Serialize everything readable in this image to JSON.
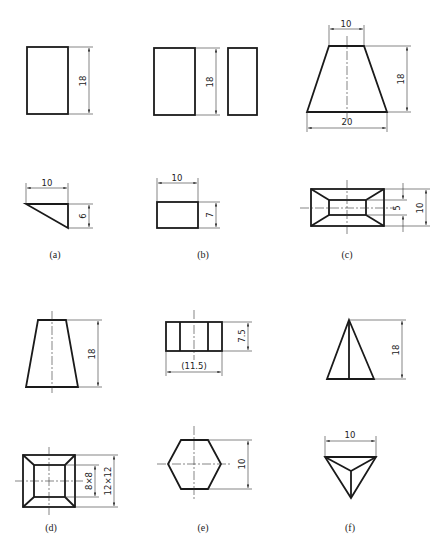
{
  "figure": {
    "panels": [
      {
        "id": "a",
        "caption": "(a)",
        "front_view": {
          "shape": "rectangle",
          "dims": {
            "height": "18"
          }
        },
        "top_view": {
          "shape": "right-triangle wedge",
          "dims": {
            "width": "10",
            "depth": "6"
          }
        }
      },
      {
        "id": "b",
        "caption": "(b)",
        "front_view": {
          "shape": "rectangle",
          "dims": {
            "height": "18"
          }
        },
        "side_view": {
          "shape": "narrow rectangle"
        },
        "top_view": {
          "shape": "rectangle",
          "dims": {
            "width": "10",
            "depth": "7"
          }
        }
      },
      {
        "id": "c",
        "caption": "(c)",
        "front_view": {
          "shape": "trapezoid",
          "dims": {
            "top": "10",
            "bottom": "20",
            "height": "18"
          }
        },
        "top_view": {
          "shape": "frustum rectangle",
          "dims": {
            "inner": "5",
            "outer": "10"
          }
        }
      },
      {
        "id": "d",
        "caption": "(d)",
        "front_view": {
          "shape": "trapezoid",
          "dims": {
            "height": "18"
          }
        },
        "top_view": {
          "shape": "square frustum",
          "dims": {
            "inner": "8×8",
            "outer": "12×12"
          }
        }
      },
      {
        "id": "e",
        "caption": "(e)",
        "front_view": {
          "shape": "hexagonal prism side",
          "dims": {
            "height": "7.5",
            "width": "(11.5)"
          }
        },
        "top_view": {
          "shape": "hexagon",
          "dims": {
            "across_flats": "10"
          }
        }
      },
      {
        "id": "f",
        "caption": "(f)",
        "front_view": {
          "shape": "triangle pyramid",
          "dims": {
            "height": "18"
          }
        },
        "top_view": {
          "shape": "triangle",
          "dims": {
            "width": "10"
          }
        }
      }
    ]
  },
  "labels": {
    "a_h18": "18",
    "a_w10": "10",
    "a_d6": "6",
    "b_h18": "18",
    "b_w10": "10",
    "b_d7": "7",
    "c_top10": "10",
    "c_h18": "18",
    "c_bot20": "20",
    "c_in5": "5",
    "c_out10": "10",
    "d_h18": "18",
    "d_in": "8×8",
    "d_out": "12×12",
    "e_h75": "7.5",
    "e_w115": "(11.5)",
    "e_hex10": "10",
    "f_h18": "18",
    "f_w10": "10"
  },
  "captions": {
    "a": "(a)",
    "b": "(b)",
    "c": "(c)",
    "d": "(d)",
    "e": "(e)",
    "f": "(f)"
  }
}
